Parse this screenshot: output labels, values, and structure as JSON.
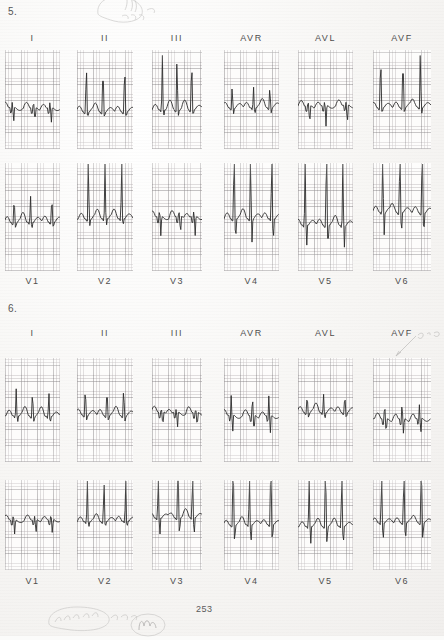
{
  "page": {
    "page_number": "253",
    "background_color": "#f7f6f4",
    "trace_color": "#2b2b2b",
    "grid_color": "#786e73"
  },
  "items": [
    {
      "number": "5.",
      "rows": [
        {
          "labels_position": "above",
          "leads": [
            {
              "label": "I",
              "baseline": 0.58,
              "r_amp": -0.3,
              "r_up": 0.06,
              "morphology": "qs-small-r"
            },
            {
              "label": "II",
              "baseline": 0.62,
              "r_amp": 0.62,
              "r_up": 0.62,
              "morphology": "tall-r"
            },
            {
              "label": "III",
              "baseline": 0.6,
              "r_amp": 0.66,
              "r_up": 0.66,
              "morphology": "tall-r"
            },
            {
              "label": "AVR",
              "baseline": 0.58,
              "r_amp": 0.26,
              "r_up": 0.26,
              "morphology": "rs"
            },
            {
              "label": "AVL",
              "baseline": 0.56,
              "r_amp": -0.4,
              "r_up": 0.04,
              "morphology": "qs-deep"
            },
            {
              "label": "AVF",
              "baseline": 0.58,
              "r_amp": 0.68,
              "r_up": 0.68,
              "morphology": "tall-r"
            }
          ]
        },
        {
          "labels_position": "below",
          "leads": [
            {
              "label": "V1",
              "baseline": 0.55,
              "r_amp": 0.3,
              "r_up": 0.3,
              "morphology": "rs"
            },
            {
              "label": "V2",
              "baseline": 0.52,
              "r_amp": 0.72,
              "r_up": 0.72,
              "morphology": "tall-r"
            },
            {
              "label": "V3",
              "baseline": 0.5,
              "r_amp": -0.35,
              "r_up": 0.05,
              "morphology": "rs-deep-s"
            },
            {
              "label": "V4",
              "baseline": 0.52,
              "r_amp": 0.95,
              "r_up": 0.95,
              "morphology": "very-tall-r-deep-s"
            },
            {
              "label": "V5",
              "baseline": 0.58,
              "r_amp": 0.95,
              "r_up": 0.95,
              "morphology": "very-tall-r-deep-s"
            },
            {
              "label": "V6",
              "baseline": 0.46,
              "r_amp": 0.95,
              "r_up": 0.95,
              "morphology": "very-tall-r-deep-s"
            }
          ]
        }
      ]
    },
    {
      "number": "6.",
      "rows": [
        {
          "labels_position": "above",
          "leads": [
            {
              "label": "I",
              "baseline": 0.56,
              "r_amp": 0.3,
              "r_up": 0.3,
              "morphology": "small-r"
            },
            {
              "label": "II",
              "baseline": 0.55,
              "r_amp": 0.34,
              "r_up": 0.34,
              "morphology": "rs"
            },
            {
              "label": "III",
              "baseline": 0.52,
              "r_amp": -0.3,
              "r_up": 0.03,
              "morphology": "qs"
            },
            {
              "label": "AVR",
              "baseline": 0.55,
              "r_amp": -0.34,
              "r_up": 0.22,
              "morphology": "rs-deep-s"
            },
            {
              "label": "AVL",
              "baseline": 0.52,
              "r_amp": 0.22,
              "r_up": 0.22,
              "morphology": "small-r"
            },
            {
              "label": "AVF",
              "baseline": 0.58,
              "r_amp": -0.3,
              "r_up": 0.16,
              "morphology": "rs-deep-s"
            }
          ]
        },
        {
          "labels_position": "below",
          "leads": [
            {
              "label": "V1",
              "baseline": 0.44,
              "r_amp": -0.32,
              "r_up": 0.05,
              "morphology": "qs"
            },
            {
              "label": "V2",
              "baseline": 0.46,
              "r_amp": 0.58,
              "r_up": 0.58,
              "morphology": "rs-deep-s"
            },
            {
              "label": "V3",
              "baseline": 0.42,
              "r_amp": 0.95,
              "r_up": 0.95,
              "morphology": "very-tall-r-deep-s"
            },
            {
              "label": "V4",
              "baseline": 0.5,
              "r_amp": 0.95,
              "r_up": 0.95,
              "morphology": "very-tall-r-deep-s"
            },
            {
              "label": "V5",
              "baseline": 0.52,
              "r_amp": 0.95,
              "r_up": 0.95,
              "morphology": "very-tall-r-deep-s"
            },
            {
              "label": "V6",
              "baseline": 0.48,
              "r_amp": 0.95,
              "r_up": 0.95,
              "morphology": "very-tall-r-deep-s"
            }
          ]
        }
      ]
    }
  ],
  "annotations": [
    {
      "name": "top-scribble",
      "text": "",
      "x": 95,
      "y": 0
    },
    {
      "name": "avf-arrow-note",
      "text": "",
      "x": 392,
      "y": 336
    },
    {
      "name": "bottom-left-scribble",
      "text": "",
      "x": 52,
      "y": 608
    },
    {
      "name": "bottom-center-scribble",
      "text": "",
      "x": 135,
      "y": 618
    }
  ]
}
